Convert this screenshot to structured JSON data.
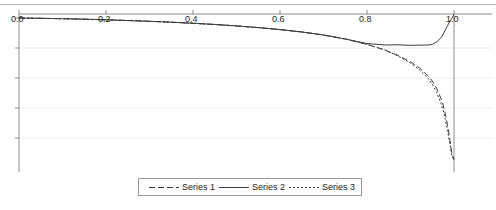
{
  "chart_data": {
    "type": "line",
    "title": "",
    "xlabel": "",
    "ylabel": "",
    "xlim": [
      0.0,
      1.0
    ],
    "ylim": [
      -2.4,
      0.1
    ],
    "grid": true,
    "legend_position": "bottom-center",
    "xticks": [
      {
        "value": 0.0,
        "label": "0.0"
      },
      {
        "value": 0.2,
        "label": "0.2"
      },
      {
        "value": 0.4,
        "label": "0.4"
      },
      {
        "value": 0.6,
        "label": "0.6"
      },
      {
        "value": 0.8,
        "label": "0.8"
      },
      {
        "value": 1.0,
        "label": "1.0"
      }
    ],
    "yticks": [
      {
        "value": 0.0,
        "label": ""
      },
      {
        "value": -0.5,
        "label": ""
      },
      {
        "value": -1.0,
        "label": ""
      },
      {
        "value": -1.5,
        "label": ""
      },
      {
        "value": -2.0,
        "label": ""
      }
    ],
    "x": [
      0.0,
      0.05,
      0.1,
      0.15,
      0.2,
      0.25,
      0.3,
      0.35,
      0.4,
      0.45,
      0.5,
      0.55,
      0.6,
      0.65,
      0.7,
      0.75,
      0.8,
      0.84,
      0.87,
      0.9,
      0.92,
      0.94,
      0.95,
      0.96,
      0.97,
      0.975,
      0.98,
      0.985,
      0.99,
      0.995,
      1.0
    ],
    "series": [
      {
        "name": "Series 1",
        "style": "dashed",
        "color": "#3c3c3c",
        "values": [
          0.0,
          -0.005,
          -0.012,
          -0.02,
          -0.03,
          -0.042,
          -0.055,
          -0.07,
          -0.088,
          -0.108,
          -0.132,
          -0.16,
          -0.193,
          -0.233,
          -0.283,
          -0.35,
          -0.44,
          -0.53,
          -0.62,
          -0.73,
          -0.83,
          -0.96,
          -1.05,
          -1.17,
          -1.34,
          -1.45,
          -1.6,
          -1.78,
          -2.0,
          -2.25,
          -2.4
        ]
      },
      {
        "name": "Series 2",
        "style": "solid",
        "color": "#3c3c3c",
        "values": [
          0.0,
          -0.005,
          -0.012,
          -0.02,
          -0.03,
          -0.042,
          -0.055,
          -0.07,
          -0.088,
          -0.108,
          -0.132,
          -0.16,
          -0.193,
          -0.233,
          -0.283,
          -0.35,
          -0.425,
          -0.45,
          -0.447,
          -0.455,
          -0.452,
          -0.45,
          -0.44,
          -0.4,
          -0.33,
          -0.27,
          -0.2,
          -0.13,
          -0.06,
          -0.01,
          0.06
        ]
      },
      {
        "name": "Series 3",
        "style": "dotted",
        "color": "#3c3c3c",
        "values": [
          0.0,
          -0.005,
          -0.012,
          -0.02,
          -0.03,
          -0.042,
          -0.055,
          -0.07,
          -0.088,
          -0.108,
          -0.132,
          -0.16,
          -0.193,
          -0.233,
          -0.283,
          -0.35,
          -0.44,
          -0.53,
          -0.63,
          -0.75,
          -0.86,
          -1.0,
          -1.1,
          -1.24,
          -1.42,
          -1.54,
          -1.69,
          -1.87,
          -2.08,
          -2.3,
          -2.4
        ]
      }
    ]
  },
  "legend": {
    "entries": [
      {
        "label": "Series 1",
        "icon": "dashed-line-sample"
      },
      {
        "label": "Series 2",
        "icon": "solid-line-sample"
      },
      {
        "label": "Series 3",
        "icon": "dotted-line-sample"
      }
    ]
  },
  "axis": {
    "x_tick_labels": [
      "0.0",
      "0.2",
      "0.4",
      "0.6",
      "0.8",
      "1.0"
    ]
  }
}
